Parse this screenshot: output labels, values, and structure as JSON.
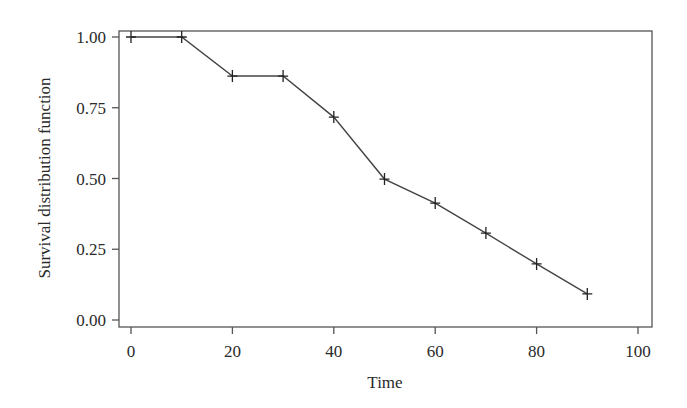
{
  "chart_data": {
    "type": "line",
    "title": "",
    "xlabel": "Time",
    "ylabel": "Survival distribution function",
    "xlim": [
      -2,
      102
    ],
    "ylim": [
      -0.02,
      1.02
    ],
    "x_ticks": [
      0,
      20,
      40,
      60,
      80,
      100
    ],
    "x_tick_labels": [
      "0",
      "20",
      "40",
      "60",
      "80",
      "100"
    ],
    "y_ticks": [
      0,
      0.25,
      0.5,
      0.75,
      1.0
    ],
    "y_tick_labels": [
      "0.00",
      "0.25",
      "0.50",
      "0.75",
      "1.00"
    ],
    "grid": false,
    "legend": null,
    "marker": "plus",
    "series": [
      {
        "name": "Survival distribution function",
        "color": "#444444",
        "x": [
          0,
          10,
          20,
          30,
          40,
          50,
          60,
          70,
          80,
          90
        ],
        "values": [
          1.0,
          1.0,
          0.862,
          0.862,
          0.717,
          0.498,
          0.413,
          0.307,
          0.198,
          0.092
        ]
      }
    ]
  }
}
